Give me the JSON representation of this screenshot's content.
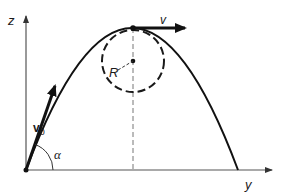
{
  "diagram": {
    "colors": {
      "stroke": "#1a1a1a",
      "axis": "#555555",
      "dashed": "#666666",
      "background": "#ffffff"
    },
    "axes": {
      "vertical_label": "z",
      "horizontal_label": "y"
    },
    "vectors": {
      "initial_velocity_label": "v",
      "initial_velocity_subscript": "0",
      "apex_velocity_label": "v"
    },
    "angle_label": "α",
    "radius_label": "R",
    "geometry": {
      "origin": [
        26,
        170
      ],
      "apex": [
        133,
        28
      ],
      "landing": [
        238,
        170
      ],
      "curvature_center": [
        133,
        61
      ],
      "curvature_radius": 31
    }
  }
}
